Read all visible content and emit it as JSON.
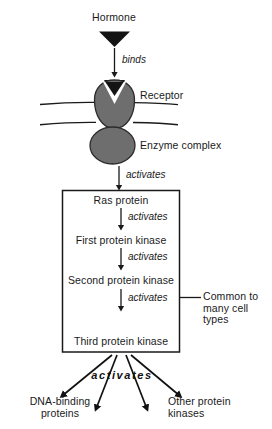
{
  "diagram": {
    "colors": {
      "protein_fill": "#6e6e6e",
      "protein_stroke": "#2b2b2b",
      "line": "#1a1a1a",
      "text": "#1a1a1a",
      "background": "#ffffff"
    },
    "top": {
      "hormone_label": "Hormone",
      "hormone_icon": "down-triangle-marker",
      "binds_label": "binds",
      "receptor_label": "Receptor",
      "receptor_icon": "receptor-blob-with-notch",
      "membrane_icon": "lipid-bilayer-lines",
      "enzyme_label": "Enzyme complex",
      "enzyme_icon": "enzyme-ellipse",
      "activates_label": "activates"
    },
    "cascade": {
      "steps": [
        {
          "label": "Ras protein"
        },
        {
          "label": "First protein kinase"
        },
        {
          "label": "Second protein kinase"
        },
        {
          "label": "Third protein kinase"
        }
      ],
      "connector_label": "activates",
      "bracket_label": "Common to\nmany cell\ntypes"
    },
    "outputs": {
      "activates_label": "activates",
      "left_label": "DNA-binding\nproteins",
      "right_label": "Other protein\nkinases",
      "arrow_count": 4
    }
  }
}
